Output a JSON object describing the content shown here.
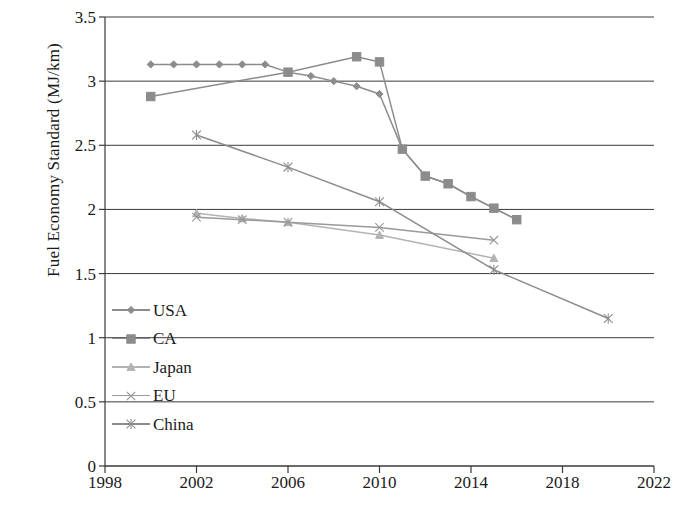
{
  "chart_data": {
    "type": "line",
    "title": "",
    "xlabel": "",
    "ylabel": "Fuel Economy Standard (MJ/km)",
    "xlim": [
      1998,
      2022
    ],
    "ylim": [
      0,
      3.5
    ],
    "xticks": [
      1998,
      2002,
      2006,
      2010,
      2014,
      2018,
      2022
    ],
    "yticks": [
      0,
      0.5,
      1,
      1.5,
      2,
      2.5,
      3,
      3.5
    ],
    "xtick_labels": [
      "1998",
      "2002",
      "2006",
      "2010",
      "2014",
      "2018",
      "2022"
    ],
    "ytick_labels": [
      "0",
      "0.5",
      "1",
      "1.5",
      "2",
      "2.5",
      "3",
      "3.5"
    ],
    "grid": "horizontal",
    "legend_position": "inside-lower-left",
    "series": [
      {
        "name": "USA",
        "marker": "diamond",
        "color": "#8c8c8c",
        "x": [
          2000,
          2001,
          2002,
          2003,
          2004,
          2005,
          2006,
          2007,
          2008,
          2009,
          2010,
          2011,
          2012,
          2013,
          2014,
          2015,
          2016
        ],
        "y": [
          3.13,
          3.13,
          3.13,
          3.13,
          3.13,
          3.13,
          3.07,
          3.04,
          3.0,
          2.96,
          2.9,
          2.47,
          2.26,
          2.2,
          2.1,
          2.01,
          1.92
        ]
      },
      {
        "name": "CA",
        "marker": "square",
        "color": "#8c8c8c",
        "x": [
          2000,
          2006,
          2009,
          2010,
          2011,
          2012,
          2013,
          2014,
          2015,
          2016
        ],
        "y": [
          2.88,
          3.07,
          3.19,
          3.15,
          2.47,
          2.26,
          2.2,
          2.1,
          2.01,
          1.92
        ]
      },
      {
        "name": "Japan",
        "marker": "triangle",
        "color": "#b3b3b3",
        "x": [
          2002,
          2004,
          2006,
          2010,
          2015
        ],
        "y": [
          1.97,
          1.93,
          1.9,
          1.8,
          1.62
        ]
      },
      {
        "name": "EU",
        "marker": "cross",
        "color": "#9a9a9a",
        "x": [
          2002,
          2004,
          2006,
          2010,
          2015
        ],
        "y": [
          1.94,
          1.92,
          1.9,
          1.86,
          1.76
        ]
      },
      {
        "name": "China",
        "marker": "asterisk",
        "color": "#8c8c8c",
        "x": [
          2002,
          2006,
          2010,
          2015,
          2020
        ],
        "y": [
          2.58,
          2.33,
          2.06,
          1.53,
          1.15
        ]
      }
    ]
  },
  "legend": {
    "items": [
      {
        "label": "USA"
      },
      {
        "label": "CA"
      },
      {
        "label": "Japan"
      },
      {
        "label": "EU"
      },
      {
        "label": "China"
      }
    ]
  }
}
